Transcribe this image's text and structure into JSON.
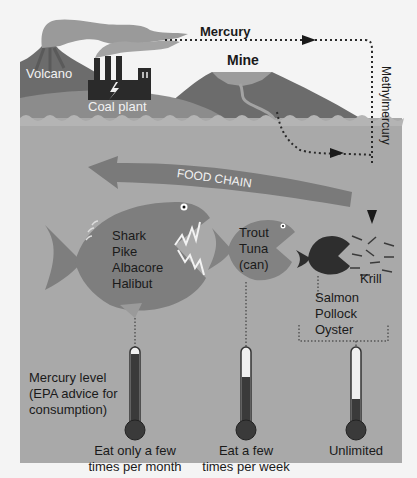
{
  "colors": {
    "background": "#f4f4f4",
    "sea": "#a8a8a8",
    "sea_foam": "#b9b9b9",
    "land_dark": "#6e6e6e",
    "land_mid": "#8a8a8a",
    "smoke": "#9a9a9a",
    "factory": "#2a2a2a",
    "arrow_band": "#7a7a7a",
    "fish_large": "#808080",
    "fish_small": "#2e2e2e",
    "thermometer_fill": "#3a3a3a",
    "dotted_line": "#2a2a2a"
  },
  "sources": {
    "volcano_label": "Volcano",
    "coal_plant_label": "Coal plant",
    "mine_label": "Mine"
  },
  "flows": {
    "mercury_label": "Mercury",
    "methylmercury_label": "Methylmercury"
  },
  "food_chain": {
    "label": "FOOD CHAIN",
    "direction": "right-to-left"
  },
  "fish_groups": [
    {
      "id": "large",
      "species": [
        "Shark",
        "Pike",
        "Albacore",
        "Halibut"
      ],
      "mercury_level_pct": 92,
      "advice_line1": "Eat only a few",
      "advice_line2": "times per month"
    },
    {
      "id": "medium",
      "species": [
        "Trout",
        "Tuna",
        "(can)"
      ],
      "mercury_level_pct": 62,
      "advice_line1": "Eat a few",
      "advice_line2": "times per week"
    },
    {
      "id": "small",
      "species": [
        "Salmon",
        "Pollock",
        "Oyster"
      ],
      "mercury_level_pct": 30,
      "advice_line1": "Unlimited",
      "advice_line2": ""
    }
  ],
  "krill_label": "Krill",
  "legend": {
    "line1": "Mercury level",
    "line2": "(EPA advice for",
    "line3": "consumption)"
  }
}
